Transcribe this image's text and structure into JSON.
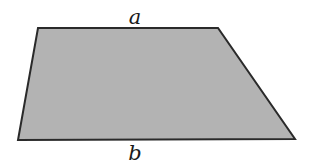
{
  "diagram": {
    "type": "trapezoid",
    "shape": {
      "vertices": [
        [
          38,
          28
        ],
        [
          218,
          28
        ],
        [
          295,
          139
        ],
        [
          18,
          140
        ]
      ],
      "fill": "#b3b3b3",
      "stroke": "#2a2a2a",
      "stroke_width": 2
    },
    "labels": {
      "top": {
        "text": "a",
        "x": 135,
        "y": 24
      },
      "bottom": {
        "text": "b",
        "x": 135,
        "y": 160
      }
    }
  }
}
